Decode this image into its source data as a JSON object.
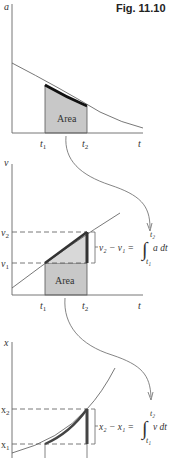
{
  "figure": {
    "title": "Fig. 11.10"
  },
  "panels": [
    {
      "id": "acceleration",
      "y_label": "a",
      "x_label": "t",
      "t1_label": "t",
      "t1_sub": "1",
      "t2_label": "t",
      "t2_sub": "2",
      "area_label": "Area"
    },
    {
      "id": "velocity",
      "y_label": "v",
      "x_label": "t",
      "t1_label": "t",
      "t1_sub": "1",
      "t2_label": "t",
      "t2_sub": "2",
      "v1_label": "v",
      "v1_sub": "1",
      "v2_label": "v",
      "v2_sub": "2",
      "area_label": "Area",
      "equation": {
        "lhs": "v₂ − v₁ =",
        "integral_upper": "t₂",
        "integral_lower": "t₁",
        "integrand": "a dt"
      }
    },
    {
      "id": "position",
      "y_label": "x",
      "x2_label": "x",
      "x2_sub": "2",
      "x1_label": "x",
      "x1_sub": "1",
      "equation": {
        "lhs": "x₂ − x₁ =",
        "integral_upper": "t₂",
        "integral_lower": "t₁",
        "integrand": "v dt"
      }
    }
  ],
  "colors": {
    "axis": "#555555",
    "curve": "#555555",
    "highlight": "#333333",
    "area_fill": "#c8c8c8",
    "area_fill_light": "#d8d8d8",
    "dash": "#555555"
  }
}
